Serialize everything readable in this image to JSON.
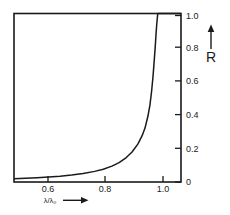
{
  "chart_data": {
    "type": "line",
    "title": "",
    "subtitle": "",
    "xlabel": "λ/λ₀",
    "ylabel": "R",
    "xlabel_arrow": "⟶",
    "ylabel_arrow": "↑",
    "xlim": [
      0.5,
      1.08
    ],
    "ylim": [
      0.0,
      1.0
    ],
    "grid": false,
    "legend": null,
    "y_axis_position": "right",
    "x_ticks": [
      0.6,
      0.8,
      1.0
    ],
    "x_tick_labels": [
      "0.6",
      "0.8",
      "1.0"
    ],
    "y_ticks": [
      0.0,
      0.2,
      0.4,
      0.6,
      0.8,
      1.0
    ],
    "y_tick_labels": [
      "0",
      "0.2",
      "0.4",
      "0.6",
      "0.8",
      "1.0"
    ],
    "series": [
      {
        "name": "R",
        "x": [
          0.5,
          0.54,
          0.58,
          0.62,
          0.66,
          0.7,
          0.74,
          0.78,
          0.81,
          0.84,
          0.865,
          0.89,
          0.91,
          0.93,
          0.945,
          0.955,
          0.965,
          0.972,
          0.978,
          0.983,
          0.987,
          0.99,
          0.993,
          0.995,
          0.997,
          0.999,
          1.0,
          1.03,
          1.08
        ],
        "values": [
          0.02,
          0.022,
          0.025,
          0.029,
          0.034,
          0.041,
          0.05,
          0.063,
          0.076,
          0.094,
          0.115,
          0.145,
          0.178,
          0.225,
          0.275,
          0.32,
          0.39,
          0.455,
          0.54,
          0.63,
          0.72,
          0.79,
          0.87,
          0.92,
          0.96,
          0.995,
          1.0,
          1.0,
          1.0
        ]
      }
    ],
    "colors": {
      "curve": "#1a1a1a",
      "axis": "#1a1a1a",
      "background": "#ffffff",
      "text": "#1a1a1a"
    }
  }
}
